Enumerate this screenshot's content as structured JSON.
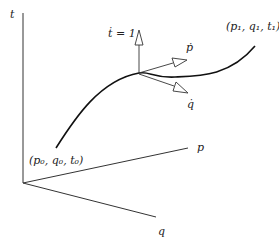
{
  "diagram": {
    "axes": {
      "t": {
        "label": "t"
      },
      "p": {
        "label": "p"
      },
      "q": {
        "label": "q"
      }
    },
    "points": {
      "start": {
        "label": "(p₀, q₀, t₀)"
      },
      "end": {
        "label": "(p₁, q₁, t₁)"
      }
    },
    "vectors": {
      "t_dot": {
        "label": "ṫ = 1"
      },
      "p_dot": {
        "label": "ṗ"
      },
      "q_dot": {
        "label": "q̇"
      }
    },
    "colors": {
      "stroke": "#222222",
      "background": "#ffffff"
    }
  }
}
